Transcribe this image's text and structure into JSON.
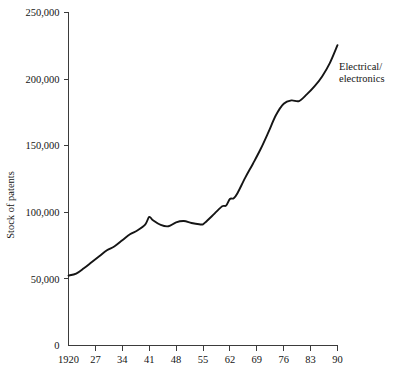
{
  "chart_data": {
    "type": "line",
    "title": "",
    "xlabel": "",
    "ylabel": "Stock of patents",
    "xlim": [
      1920,
      1990
    ],
    "ylim": [
      0,
      250000
    ],
    "grid": false,
    "legend_position": "inline-annotation-right",
    "y_ticks": [
      0,
      50000,
      100000,
      150000,
      200000,
      250000
    ],
    "y_tick_labels": [
      "0",
      "50,000",
      "100,000",
      "150,000",
      "200,000",
      "250,000"
    ],
    "x_ticks": [
      1920,
      1927,
      1934,
      1941,
      1948,
      1955,
      1962,
      1969,
      1976,
      1983,
      1990
    ],
    "x_tick_labels": [
      "1920",
      "27",
      "34",
      "41",
      "48",
      "55",
      "62",
      "69",
      "76",
      "83",
      "90"
    ],
    "series": [
      {
        "name": "Electrical/electronics",
        "annotation_lines": [
          "Electrical/",
          "electronics"
        ],
        "color": "#151515",
        "x": [
          1920,
          1922,
          1924,
          1926,
          1928,
          1930,
          1932,
          1934,
          1936,
          1938,
          1940,
          1941,
          1942,
          1944,
          1946,
          1948,
          1950,
          1952,
          1954,
          1955,
          1956,
          1958,
          1960,
          1961,
          1962,
          1963,
          1964,
          1966,
          1968,
          1970,
          1972,
          1974,
          1976,
          1978,
          1980,
          1982,
          1984,
          1986,
          1988,
          1990
        ],
        "values": [
          52500,
          54000,
          58000,
          62500,
          67000,
          71500,
          74500,
          79000,
          83500,
          86500,
          91000,
          96500,
          94000,
          90500,
          89500,
          92500,
          93500,
          92000,
          91000,
          91000,
          93500,
          99000,
          104500,
          105000,
          110000,
          110500,
          114500,
          126000,
          136500,
          147500,
          160000,
          173000,
          181500,
          184000,
          183500,
          188500,
          194500,
          202000,
          212000,
          225500
        ]
      }
    ]
  }
}
